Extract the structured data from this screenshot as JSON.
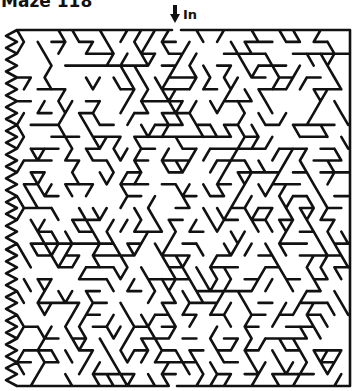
{
  "title": "Maze 118",
  "entry": {
    "label": "In",
    "icon": "down-arrow-icon"
  },
  "maze": {
    "style": "triangular-lattice",
    "line_color": "#111111",
    "line_width": 2.6,
    "bounds": {
      "left": 11,
      "top": 30,
      "right": 350,
      "bottom": 386
    },
    "row_height": 11.9,
    "cell_width": 13.8,
    "entry_gap": {
      "x1": 172,
      "x2": 181
    },
    "exit_gap": {
      "x1": 167,
      "x2": 177
    },
    "seed": 118
  }
}
